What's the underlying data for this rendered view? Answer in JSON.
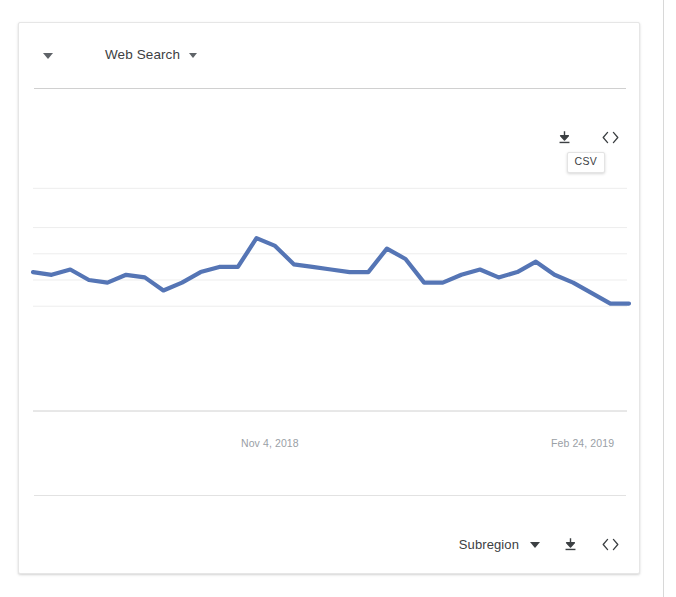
{
  "card": {
    "header": {
      "collapse_caret_icon": "caret-down-icon",
      "title": "Web Search",
      "title_caret_icon": "caret-down-icon"
    },
    "plot_actions": {
      "download_icon": "download-icon",
      "embed_icon": "embed-code-icon",
      "tooltip": "CSV"
    },
    "footer": {
      "subregion_label": "Subregion",
      "subregion_caret_icon": "caret-down-icon",
      "download_icon": "download-icon",
      "embed_icon": "embed-code-icon"
    }
  },
  "colors": {
    "line": "#5575b5",
    "gridline": "#ededed",
    "axis": "#d0d0d0",
    "text_primary": "#3c4043",
    "text_muted": "#9aa0a6"
  },
  "chart_data": {
    "type": "line",
    "title": "",
    "xlabel": "",
    "ylabel": "",
    "grid": true,
    "legend": false,
    "series_color": "#5575b5",
    "xlim": [
      "2018-09-30",
      "2019-03-03"
    ],
    "ylim": [
      0,
      100
    ],
    "tick_labels": [
      "Nov 4, 2018",
      "Feb 24, 2019"
    ],
    "tick_positions": [
      0.5,
      0.98
    ],
    "gridline_values": [
      85,
      70,
      60,
      50,
      40
    ],
    "x": [
      0,
      1,
      2,
      3,
      4,
      5,
      6,
      7,
      8,
      9,
      10,
      11,
      12,
      13,
      14,
      15,
      16,
      17,
      18,
      19,
      20,
      21,
      22,
      23,
      24,
      25,
      26,
      27,
      28,
      29,
      30,
      31,
      32
    ],
    "series": [
      {
        "name": "Web Search interest",
        "values": [
          53,
          52,
          54,
          50,
          49,
          52,
          51,
          46,
          49,
          53,
          55,
          55,
          66,
          63,
          56,
          55,
          54,
          53,
          53,
          62,
          58,
          49,
          49,
          52,
          54,
          51,
          53,
          57,
          52,
          49,
          45,
          41,
          41
        ]
      }
    ]
  }
}
